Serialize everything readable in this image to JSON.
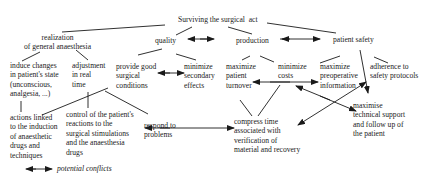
{
  "diagram": {
    "root": "Surviving the surgical  act",
    "nodes": {
      "anaesthesia": "realization\nof general anaesthesia",
      "quality": "quality",
      "production": "production",
      "patient_safety": "patient safety",
      "induce_changes": "induce changes\nin patient's state\n(unconscious,\nanalgesia, ...)",
      "adjustment": "adjustment\nin real\ntime",
      "provide_conditions": "provide good\nsurgical\nconditions",
      "minimize_effects": "minimize\nsecondary\neffects",
      "maximize_turnover": "maximize\npatient\nturnover",
      "minimize_costs": "minimize\ncosts",
      "maximize_info": "maximize\npreoperative\ninformation",
      "adherence": "adherence to\nsafety protocols",
      "actions_induction": "actions linked\nto the induction\nof anaesthetic\ndrugs and\ntechniques",
      "control_reactions": "control of the patient's\nreactions to the\nsurgical stimulations\nand the anaesthesia\ndrugs",
      "respond_problems": "respond to\nproblems",
      "compress_time": "compress time\nassociated with\nverification of\nmaterial and recovery",
      "technical_support": "maximise\ntechnical support\nand follow up of\nthe patient"
    },
    "edges": [
      [
        "root",
        "anaesthesia"
      ],
      [
        "root",
        "quality"
      ],
      [
        "root",
        "production"
      ],
      [
        "root",
        "patient_safety"
      ],
      [
        "anaesthesia",
        "induce_changes"
      ],
      [
        "anaesthesia",
        "adjustment"
      ],
      [
        "quality",
        "provide_conditions"
      ],
      [
        "quality",
        "minimize_effects"
      ],
      [
        "production",
        "maximize_turnover"
      ],
      [
        "production",
        "minimize_costs"
      ],
      [
        "patient_safety",
        "maximize_info"
      ],
      [
        "patient_safety",
        "adherence"
      ],
      [
        "induce_changes",
        "actions_induction"
      ],
      [
        "adjustment",
        "control_reactions"
      ],
      [
        "provide_conditions",
        "actions_induction"
      ],
      [
        "provide_conditions",
        "respond_problems"
      ],
      [
        "maximize_turnover",
        "compress_time"
      ],
      [
        "minimize_costs",
        "compress_time"
      ]
    ],
    "conflicts": [
      [
        "quality",
        "production"
      ],
      [
        "production",
        "patient_safety"
      ],
      [
        "provide_conditions",
        "minimize_effects"
      ],
      [
        "maximize_turnover",
        "maximize_info"
      ],
      [
        "respond_problems",
        "compress_time"
      ],
      [
        "minimize_costs",
        "technical_support"
      ],
      [
        "patient_safety",
        "technical_support"
      ],
      [
        "compress_time",
        "maximize_info"
      ]
    ],
    "legend": {
      "label": "potential conflicts"
    }
  }
}
